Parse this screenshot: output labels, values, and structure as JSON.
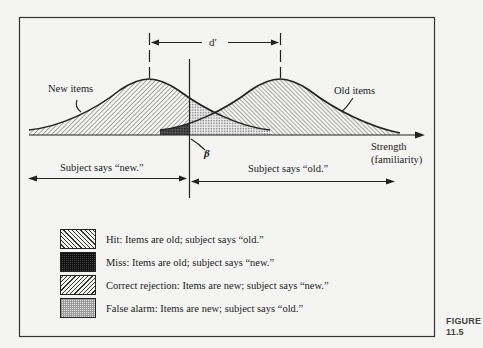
{
  "figure": {
    "number_label": "FIGURE",
    "number": "11.5"
  },
  "diagram": {
    "d_prime_label": "d′",
    "beta_label": "β",
    "new_items_label": "New items",
    "old_items_label": "Old items",
    "axis_label_line1": "Strength",
    "axis_label_line2": "(familiarity)",
    "says_new_label": "Subject says “new.”",
    "says_old_label": "Subject says “old.”"
  },
  "legend": {
    "items": [
      {
        "pattern": "hit",
        "label": "Hit: Items are old; subject says “old.”"
      },
      {
        "pattern": "miss",
        "label": "Miss: Items are old; subject says “new.”"
      },
      {
        "pattern": "correct-rejection",
        "label": "Correct rejection: Items are new; subject says “new.”"
      },
      {
        "pattern": "false-alarm",
        "label": "False alarm: Items are new; subject says “old.”"
      }
    ]
  },
  "colors": {
    "ink": "#222222",
    "paper": "#f4f4f2"
  }
}
